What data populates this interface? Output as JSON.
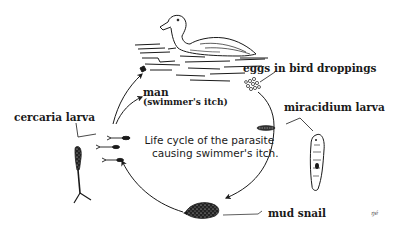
{
  "diagram": {
    "title_line1": "Life cycle of  the parasite",
    "title_line2": "causing swimmer's itch.",
    "stages": [
      {
        "id": "bird",
        "label": "",
        "drawing": "duck-swimming-on-water"
      },
      {
        "id": "eggs",
        "label": "eggs in bird droppings"
      },
      {
        "id": "miracidium",
        "label": "miracidium larva"
      },
      {
        "id": "snail",
        "label": "mud snail"
      },
      {
        "id": "cercaria",
        "label": "cercaria larva"
      },
      {
        "id": "man",
        "label": "man",
        "sublabel": "(swimmer's itch)"
      }
    ],
    "cycle_order": [
      "bird",
      "eggs",
      "miracidium",
      "snail",
      "cercaria",
      "bird"
    ],
    "side_branch": {
      "from": "cercaria",
      "to": "man"
    },
    "signature": "ŋé",
    "colors": {
      "ink": "#1a1a1a",
      "background": "#ffffff"
    }
  }
}
